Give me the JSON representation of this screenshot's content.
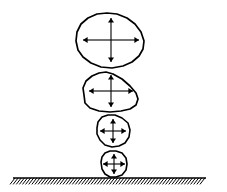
{
  "figure": {
    "background_color": "#ffffff",
    "stroke_color": "#000000",
    "width": 227,
    "height": 192
  },
  "ground": {
    "label": "hatched ground surface",
    "line_x_start": 13,
    "line_x_end": 206,
    "line_y": 178,
    "hatch_count": 62,
    "hatch_length": 8,
    "hatch_lean": "right",
    "color": "#000000"
  },
  "arrow_set": {
    "label": "four radial arrows pointing outward from center",
    "directions": [
      "up",
      "down",
      "left",
      "right"
    ],
    "color": "#000000"
  },
  "particles": [
    {
      "name": "particle-1",
      "order": 1,
      "size_label": "largest",
      "center_x": 111,
      "center_y": 40,
      "radius_x": 35,
      "radius_y": 27,
      "stroke_width": 1.7,
      "outline_points": "76,41 77,32 81,24 88,18 97,14 107,13 117,14 127,18 135,24 141,32 144,41 143,49 139,56 132,62 123,66 112,68 101,67 91,63 83,57 78,50",
      "arrow_up": 22,
      "arrow_down": 22,
      "arrow_left": 28,
      "arrow_right": 28
    },
    {
      "name": "particle-2",
      "order": 2,
      "size_label": "large",
      "center_x": 111,
      "center_y": 91,
      "radius_x": 28,
      "radius_y": 20,
      "stroke_width": 1.7,
      "outline_points": "84,95 83,88 86,81 92,76 99,73 106,72 113,74 122,79 130,86 136,93 138,99 136,105 130,109 121,111 110,112 99,111 90,108 85,103",
      "arrow_up": 16,
      "arrow_down": 16,
      "arrow_left": 22,
      "arrow_right": 22
    },
    {
      "name": "particle-3",
      "order": 3,
      "size_label": "small",
      "center_x": 113,
      "center_y": 131,
      "radius_x": 17,
      "radius_y": 16,
      "stroke_width": 1.6,
      "outline_points": "97,128 98,122 102,117 108,115 115,115 122,118 128,123 130,130 129,137 125,143 119,146 112,147 105,145 100,140 97,134",
      "arrow_up": 12,
      "arrow_down": 12,
      "arrow_left": 13,
      "arrow_right": 13
    },
    {
      "name": "particle-4",
      "order": 4,
      "size_label": "smallest",
      "center_x": 114,
      "center_y": 164,
      "radius_x": 14,
      "radius_y": 14,
      "stroke_width": 1.6,
      "outline_points": "101,162 102,157 105,153 110,151 116,151 122,153 126,158 127,164 126,170 122,175 116,177 110,177 105,174 102,169",
      "arrow_up": 10,
      "arrow_down": 10,
      "arrow_left": 11,
      "arrow_right": 11
    }
  ]
}
